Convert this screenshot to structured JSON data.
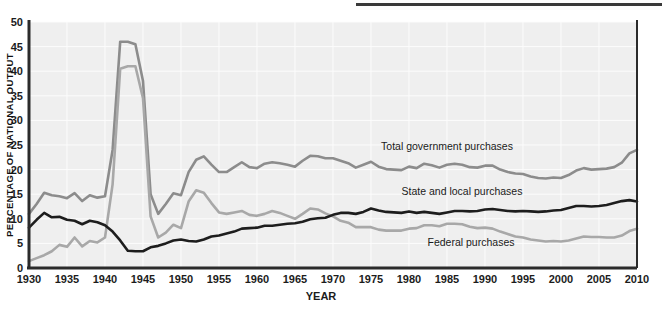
{
  "figure": {
    "background_color": "#ffffff",
    "plot_background_color": "#efefef",
    "gridline_color": "#fcfcfc",
    "axis_color": "#2b2b2b",
    "top_rule_color": "#3a3a3a"
  },
  "axes": {
    "y_axis_title": "PERCENTAGE OF NATIONAL OUTPUT",
    "x_axis_title": "YEAR",
    "y_ticks": [
      "0",
      "5",
      "10",
      "15",
      "20",
      "25",
      "30",
      "35",
      "40",
      "45",
      "50"
    ],
    "x_ticks": [
      "1930",
      "1935",
      "1940",
      "1945",
      "1950",
      "1955",
      "1960",
      "1965",
      "1970",
      "1975",
      "1980",
      "1985",
      "1990",
      "1995",
      "2000",
      "2005",
      "2010"
    ]
  },
  "series_labels": {
    "total": "Total government purchases",
    "state_local": "State and local purchases",
    "federal": "Federal purchases"
  },
  "chart_data": {
    "type": "line",
    "title": "",
    "subtitle": "",
    "xlabel": "YEAR",
    "ylabel": "PERCENTAGE OF NATIONAL OUTPUT",
    "xlim": [
      1930,
      2010
    ],
    "ylim": [
      0,
      50
    ],
    "ytick_step": 5,
    "xtick_step": 5,
    "grid": true,
    "legend_position": "inline-annotations",
    "x": [
      1930,
      1931,
      1932,
      1933,
      1934,
      1935,
      1936,
      1937,
      1938,
      1939,
      1940,
      1941,
      1942,
      1943,
      1944,
      1945,
      1946,
      1947,
      1948,
      1949,
      1950,
      1951,
      1952,
      1953,
      1954,
      1955,
      1956,
      1957,
      1958,
      1959,
      1960,
      1961,
      1962,
      1963,
      1964,
      1965,
      1966,
      1967,
      1968,
      1969,
      1970,
      1971,
      1972,
      1973,
      1974,
      1975,
      1976,
      1977,
      1978,
      1979,
      1980,
      1981,
      1982,
      1983,
      1984,
      1985,
      1986,
      1987,
      1988,
      1989,
      1990,
      1991,
      1992,
      1993,
      1994,
      1995,
      1996,
      1997,
      1998,
      1999,
      2000,
      2001,
      2002,
      2003,
      2004,
      2005,
      2006,
      2007,
      2008,
      2009,
      2010
    ],
    "series": [
      {
        "name": "Total government purchases",
        "color": "#8c8c8c",
        "values": [
          11.0,
          13.0,
          15.3,
          14.8,
          14.6,
          14.2,
          15.2,
          13.6,
          14.8,
          14.3,
          14.6,
          24.0,
          46.0,
          46.0,
          45.5,
          38.0,
          15.0,
          11.0,
          13.0,
          15.2,
          14.8,
          19.5,
          22.0,
          22.7,
          21.0,
          19.5,
          19.5,
          20.5,
          21.5,
          20.5,
          20.3,
          21.2,
          21.5,
          21.3,
          21.0,
          20.6,
          21.8,
          22.8,
          22.7,
          22.3,
          22.3,
          21.8,
          21.3,
          20.4,
          21.0,
          21.6,
          20.6,
          20.1,
          20.0,
          19.9,
          20.6,
          20.3,
          21.2,
          20.9,
          20.4,
          21.0,
          21.2,
          21.0,
          20.5,
          20.4,
          20.8,
          20.8,
          20.0,
          19.5,
          19.2,
          19.1,
          18.6,
          18.3,
          18.2,
          18.4,
          18.3,
          18.9,
          19.8,
          20.3,
          20.0,
          20.1,
          20.2,
          20.5,
          21.4,
          23.3,
          24.0
        ]
      },
      {
        "name": "State and local purchases",
        "color": "#1d1d1d",
        "values": [
          8.2,
          9.8,
          11.2,
          10.3,
          10.4,
          9.8,
          9.6,
          8.9,
          9.6,
          9.3,
          8.7,
          7.4,
          5.6,
          3.5,
          3.4,
          3.4,
          4.2,
          4.5,
          5.0,
          5.6,
          5.8,
          5.5,
          5.4,
          5.8,
          6.4,
          6.6,
          7.0,
          7.4,
          8.0,
          8.1,
          8.2,
          8.6,
          8.6,
          8.8,
          9.0,
          9.1,
          9.4,
          9.9,
          10.1,
          10.2,
          10.8,
          11.2,
          11.2,
          11.0,
          11.4,
          12.1,
          11.7,
          11.4,
          11.3,
          11.2,
          11.5,
          11.2,
          11.4,
          11.2,
          11.0,
          11.3,
          11.6,
          11.6,
          11.5,
          11.6,
          11.9,
          12.0,
          11.8,
          11.6,
          11.5,
          11.6,
          11.5,
          11.4,
          11.5,
          11.7,
          11.8,
          12.2,
          12.6,
          12.6,
          12.5,
          12.6,
          12.8,
          13.2,
          13.6,
          13.8,
          13.5
        ]
      },
      {
        "name": "Federal purchases",
        "color": "#a8a8a8",
        "values": [
          1.4,
          2.0,
          2.6,
          3.4,
          4.7,
          4.3,
          6.2,
          4.4,
          5.5,
          5.2,
          6.2,
          17.0,
          40.5,
          41.0,
          41.0,
          34.5,
          10.5,
          6.2,
          7.2,
          8.8,
          8.1,
          13.5,
          15.8,
          15.3,
          13.2,
          11.3,
          11.0,
          11.3,
          11.6,
          10.8,
          10.6,
          11.0,
          11.6,
          11.2,
          10.6,
          10.0,
          11.0,
          12.1,
          11.9,
          11.1,
          10.5,
          9.6,
          9.2,
          8.3,
          8.3,
          8.3,
          7.8,
          7.6,
          7.6,
          7.6,
          8.0,
          8.1,
          8.7,
          8.7,
          8.5,
          9.0,
          9.0,
          8.9,
          8.4,
          8.1,
          8.2,
          8.0,
          7.4,
          6.9,
          6.4,
          6.2,
          5.8,
          5.6,
          5.4,
          5.5,
          5.4,
          5.6,
          6.0,
          6.4,
          6.3,
          6.3,
          6.2,
          6.2,
          6.6,
          7.5,
          8.0
        ]
      }
    ]
  }
}
